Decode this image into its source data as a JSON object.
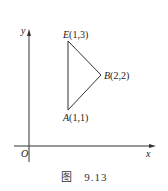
{
  "figure": {
    "caption_prefix": "图",
    "caption_number": "9.13"
  },
  "axes": {
    "x_label": "x",
    "y_label": "y",
    "origin_label": "O"
  },
  "points": [
    {
      "name": "E",
      "coords": "(1,3)"
    },
    {
      "name": "B",
      "coords": "(2,2)"
    },
    {
      "name": "A",
      "coords": "(1,1)"
    }
  ],
  "colors": {
    "stroke": "#333333",
    "background": "#ffffff"
  }
}
